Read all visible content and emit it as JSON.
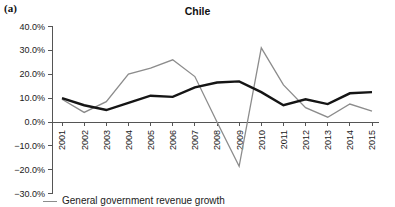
{
  "panel": {
    "label": "(a)"
  },
  "legend": {
    "items": [
      {
        "name": "General government revenue growth",
        "color": "#8c8c8c"
      }
    ]
  },
  "chart_data": {
    "type": "line",
    "title": "Chile",
    "xlabel": "",
    "ylabel": "",
    "categories": [
      "2001",
      "2002",
      "2003",
      "2004",
      "2005",
      "2006",
      "2007",
      "2008",
      "2009",
      "2010",
      "2011",
      "2012",
      "2013",
      "2014",
      "2015"
    ],
    "x": [
      2001,
      2002,
      2003,
      2004,
      2005,
      2006,
      2007,
      2008,
      2009,
      2010,
      2011,
      2012,
      2013,
      2014,
      2015
    ],
    "ylim": [
      -30,
      40
    ],
    "yticks": [
      40,
      30,
      20,
      10,
      0,
      -10,
      -20,
      -30
    ],
    "ytick_labels": [
      "40.0%",
      "30.0%",
      "20.0%",
      "10.0%",
      "0.0%",
      "−10.0%",
      "−20.0%",
      "−30.0%"
    ],
    "xtick_labels": [
      "2001",
      "2002",
      "2003",
      "2004",
      "2005",
      "2006",
      "2007",
      "2008",
      "2009",
      "2010",
      "2011",
      "2012",
      "2013",
      "2014",
      "2015"
    ],
    "grid": false,
    "legend_position": "bottom-left",
    "series": [
      {
        "name": "General government revenue growth",
        "color": "#8c8c8c",
        "values": [
          9.5,
          4.0,
          8.5,
          20.0,
          22.5,
          26.0,
          19.0,
          0.0,
          -18.5,
          31.0,
          15.5,
          6.0,
          2.0,
          7.5,
          4.5
        ]
      },
      {
        "name": "General government expenditure growth",
        "color": "#151515",
        "values": [
          10.0,
          7.0,
          5.0,
          8.0,
          11.0,
          10.5,
          14.5,
          16.5,
          17.0,
          12.5,
          7.0,
          9.5,
          7.5,
          12.0,
          12.5
        ]
      }
    ]
  }
}
